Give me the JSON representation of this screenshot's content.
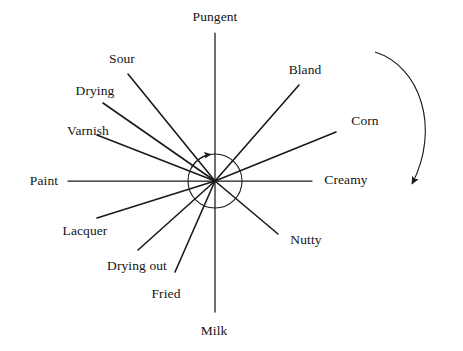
{
  "figure": {
    "title": "",
    "type": "radial-attribute-diagram",
    "background_color": "#ffffff",
    "line_color": "#1a1a1a",
    "text_color": "#141414"
  },
  "chart_data": {
    "type": "scatter",
    "title": "",
    "subtitle": "",
    "xlabel": "",
    "ylabel": "",
    "grid": false,
    "legend": "none",
    "center": {
      "x": 215,
      "y": 181
    },
    "inner_circle_radius": 27,
    "rotation_arrow": {
      "label": "clockwise-rotation-arrow",
      "direction": "clockwise",
      "start": {
        "x": 375,
        "y": 52
      },
      "end": {
        "x": 411,
        "y": 190
      }
    },
    "categories": [
      "Pungent",
      "Bland",
      "Corn",
      "Creamy",
      "Nutty",
      "Milk",
      "Fried",
      "Drying out",
      "Lacquer",
      "Paint",
      "Varnish",
      "Drying",
      "Sour"
    ],
    "spokes": [
      {
        "label": "Pungent",
        "angle_deg": 90,
        "end": {
          "x": 215,
          "y": 33
        },
        "label_pos": {
          "x": 215,
          "y": 17
        },
        "anchor": "mid"
      },
      {
        "label": "Sour",
        "angle_deg": 128,
        "end": {
          "x": 128,
          "y": 74
        },
        "label_pos": {
          "x": 122,
          "y": 59
        },
        "anchor": "mid"
      },
      {
        "label": "Drying",
        "angle_deg": 145,
        "end": {
          "x": 103,
          "y": 103
        },
        "label_pos": {
          "x": 95,
          "y": 91
        },
        "anchor": "mid"
      },
      {
        "label": "Varnish",
        "angle_deg": 159,
        "end": {
          "x": 97,
          "y": 135
        },
        "label_pos": {
          "x": 88,
          "y": 131
        },
        "anchor": "mid"
      },
      {
        "label": "Paint",
        "angle_deg": 180,
        "end": {
          "x": 68,
          "y": 181
        },
        "label_pos": {
          "x": 44,
          "y": 181
        },
        "anchor": "mid"
      },
      {
        "label": "Lacquer",
        "angle_deg": 200,
        "end": {
          "x": 97,
          "y": 218
        },
        "label_pos": {
          "x": 85,
          "y": 231
        },
        "anchor": "mid"
      },
      {
        "label": "Drying out",
        "angle_deg": 217,
        "end": {
          "x": 138,
          "y": 250
        },
        "label_pos": {
          "x": 137,
          "y": 266
        },
        "anchor": "mid"
      },
      {
        "label": "Fried",
        "angle_deg": 244,
        "end": {
          "x": 175,
          "y": 272
        },
        "label_pos": {
          "x": 166,
          "y": 294
        },
        "anchor": "mid"
      },
      {
        "label": "Milk",
        "angle_deg": 270,
        "end": {
          "x": 215,
          "y": 312
        },
        "label_pos": {
          "x": 214,
          "y": 331
        },
        "anchor": "mid"
      },
      {
        "label": "Nutty",
        "angle_deg": 322,
        "end": {
          "x": 278,
          "y": 234
        },
        "label_pos": {
          "x": 306,
          "y": 240
        },
        "anchor": "mid"
      },
      {
        "label": "Creamy",
        "angle_deg": 0,
        "end": {
          "x": 312,
          "y": 181
        },
        "label_pos": {
          "x": 346,
          "y": 180
        },
        "anchor": "mid"
      },
      {
        "label": "Corn",
        "angle_deg": 33,
        "end": {
          "x": 336,
          "y": 132
        },
        "label_pos": {
          "x": 365,
          "y": 121
        },
        "anchor": "mid"
      },
      {
        "label": "Bland",
        "angle_deg": 53,
        "end": {
          "x": 299,
          "y": 85
        },
        "label_pos": {
          "x": 305,
          "y": 70
        },
        "anchor": "mid"
      }
    ]
  },
  "labels": {
    "pungent": "Pungent",
    "sour": "Sour",
    "drying": "Drying",
    "varnish": "Varnish",
    "paint": "Paint",
    "lacquer": "Lacquer",
    "drying_out": "Drying out",
    "fried": "Fried",
    "milk": "Milk",
    "nutty": "Nutty",
    "creamy": "Creamy",
    "corn": "Corn",
    "bland": "Bland"
  }
}
